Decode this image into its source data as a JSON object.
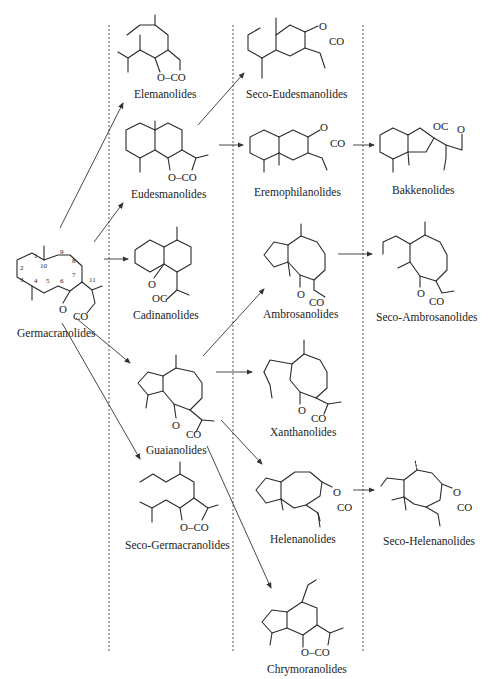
{
  "diagram": {
    "type": "biogenetic-relationship-scheme",
    "colors": {
      "ink": "#2a2a2a",
      "background": "#ffffff"
    },
    "precursor": {
      "label": "Germacranolides",
      "ring_numbers": [
        "1",
        "2",
        "3",
        "4",
        "5",
        "6",
        "7",
        "8",
        "9",
        "10",
        "11"
      ],
      "lactone": {
        "o": "O",
        "co": "CO"
      }
    },
    "column1": [
      {
        "label": "Elemanolides",
        "lactone": "O–CO"
      },
      {
        "label": "Eudesmanolides",
        "lactone": "O–CO"
      },
      {
        "label": "Cadinanolides",
        "lactone_o": "O",
        "lactone_co": "OC"
      },
      {
        "label": "Guaianolides",
        "lactone_o": "O",
        "lactone_co": "CO"
      },
      {
        "label": "Seco-Germacranolides",
        "lactone": "O–CO"
      }
    ],
    "column2": [
      {
        "label": "Seco-Eudesmanolides",
        "lactone_o": "O",
        "lactone_co": "CO"
      },
      {
        "label": "Eremophilanolides",
        "lactone_o": "O",
        "lactone_co": "CO"
      },
      {
        "label": "Ambrosanolides",
        "lactone_o": "O",
        "lactone_co": "CO"
      },
      {
        "label": "Xanthanolides",
        "lactone_o": "O",
        "lactone_co": "CO"
      },
      {
        "label": "Helenanolides",
        "lactone_o": "O",
        "lactone_co": "CO"
      },
      {
        "label": "Chrymoranolides",
        "lactone": "O–CO"
      }
    ],
    "column3": [
      {
        "label": "Bakkenolides",
        "lactone_oc": "OC",
        "lactone_o": "O"
      },
      {
        "label": "Seco-Ambrosanolides",
        "lactone_o": "O",
        "lactone_co": "CO"
      },
      {
        "label": "Seco-Helenanolides",
        "lactone_o": "O",
        "lactone_co": "CO"
      }
    ],
    "arrows": [
      {
        "from": "Germacranolides",
        "to": "Elemanolides"
      },
      {
        "from": "Germacranolides",
        "to": "Eudesmanolides"
      },
      {
        "from": "Germacranolides",
        "to": "Cadinanolides"
      },
      {
        "from": "Germacranolides",
        "to": "Guaianolides"
      },
      {
        "from": "Germacranolides",
        "to": "Seco-Germacranolides"
      },
      {
        "from": "Eudesmanolides",
        "to": "Seco-Eudesmanolides"
      },
      {
        "from": "Eudesmanolides",
        "to": "Eremophilanolides"
      },
      {
        "from": "Eremophilanolides",
        "to": "Bakkenolides"
      },
      {
        "from": "Guaianolides",
        "to": "Ambrosanolides"
      },
      {
        "from": "Guaianolides",
        "to": "Xanthanolides"
      },
      {
        "from": "Guaianolides",
        "to": "Helenanolides"
      },
      {
        "from": "Guaianolides",
        "to": "Chrymoranolides"
      },
      {
        "from": "Ambrosanolides",
        "to": "Seco-Ambrosanolides"
      },
      {
        "from": "Helenanolides",
        "to": "Seco-Helenanolides"
      }
    ]
  }
}
